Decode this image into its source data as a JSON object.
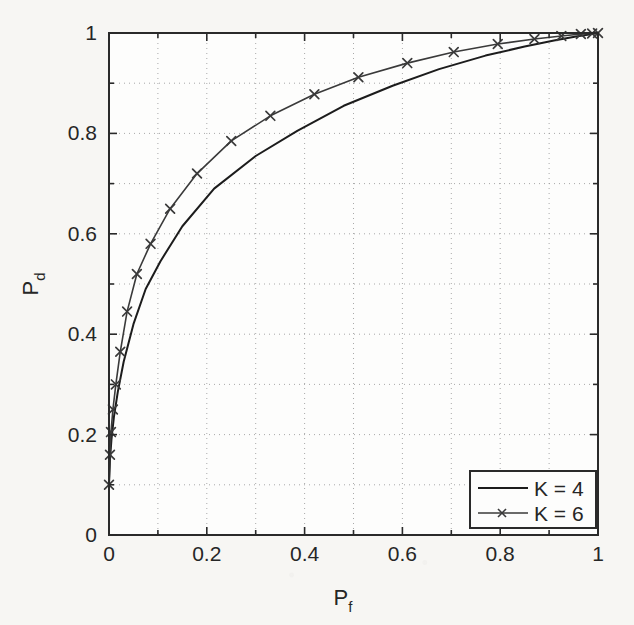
{
  "chart_data": {
    "type": "line",
    "title": "",
    "subtitle": "",
    "xlabel": "P_f",
    "ylabel": "P_d",
    "xlabel_base": "P",
    "xlabel_sub": "f",
    "ylabel_base": "P",
    "ylabel_sub": "d",
    "xlim": [
      0,
      1
    ],
    "ylim": [
      0,
      1
    ],
    "xticks": [
      0,
      0.2,
      0.4,
      0.6,
      0.8,
      1
    ],
    "yticks": [
      0,
      0.2,
      0.4,
      0.6,
      0.8,
      1
    ],
    "xtick_labels": [
      "0",
      "0.2",
      "0.4",
      "0.6",
      "0.8",
      "1"
    ],
    "ytick_labels": [
      "0",
      "0.2",
      "0.4",
      "0.6",
      "0.8",
      "1"
    ],
    "minor_tick_step": 0.1,
    "grid": true,
    "grid_style": "dotted",
    "grid_color": "#9a9a9a",
    "axis_color": "#2a2a2a",
    "background_color": "#f7f6f3",
    "legend_position": "lower right",
    "series": [
      {
        "name": "K = 4",
        "marker": "none",
        "color": "#1c1c1c",
        "line_width": 2.0,
        "x": [
          0.0,
          0.002,
          0.005,
          0.01,
          0.018,
          0.03,
          0.05,
          0.075,
          0.105,
          0.15,
          0.215,
          0.3,
          0.385,
          0.48,
          0.58,
          0.675,
          0.77,
          0.85,
          0.91,
          0.955,
          0.982,
          1.0
        ],
        "y": [
          0.1,
          0.15,
          0.19,
          0.235,
          0.285,
          0.345,
          0.42,
          0.49,
          0.545,
          0.615,
          0.69,
          0.755,
          0.805,
          0.855,
          0.895,
          0.928,
          0.955,
          0.973,
          0.985,
          0.993,
          0.997,
          1.0
        ]
      },
      {
        "name": "K = 6",
        "marker": "x",
        "color": "#3a3a3a",
        "line_width": 1.6,
        "x": [
          0.0,
          0.002,
          0.004,
          0.008,
          0.014,
          0.023,
          0.037,
          0.057,
          0.085,
          0.125,
          0.18,
          0.25,
          0.33,
          0.42,
          0.51,
          0.61,
          0.705,
          0.795,
          0.87,
          0.925,
          0.965,
          0.988,
          1.0
        ],
        "y": [
          0.1,
          0.16,
          0.205,
          0.25,
          0.3,
          0.365,
          0.445,
          0.52,
          0.58,
          0.65,
          0.72,
          0.785,
          0.835,
          0.878,
          0.912,
          0.94,
          0.962,
          0.978,
          0.988,
          0.994,
          0.998,
          0.999,
          1.0
        ],
        "markers_x": [
          0.0,
          0.002,
          0.004,
          0.008,
          0.014,
          0.023,
          0.037,
          0.057,
          0.085,
          0.125,
          0.18,
          0.25,
          0.33,
          0.42,
          0.51,
          0.61,
          0.705,
          0.795,
          0.87,
          0.925,
          0.965,
          0.988,
          1.0
        ],
        "markers_y": [
          0.1,
          0.16,
          0.205,
          0.25,
          0.3,
          0.365,
          0.445,
          0.52,
          0.58,
          0.65,
          0.72,
          0.785,
          0.835,
          0.878,
          0.912,
          0.94,
          0.962,
          0.978,
          0.988,
          0.994,
          0.998,
          0.999,
          1.0
        ]
      }
    ],
    "legend": [
      {
        "label": "K = 4",
        "marker": "none"
      },
      {
        "label": "K = 6",
        "marker": "x"
      }
    ]
  },
  "legend_entries": {
    "entry0_label": "K = 4",
    "entry1_label": "K = 6"
  },
  "axis_labels": {
    "x_base": "P",
    "x_sub": "f",
    "y_base": "P",
    "y_sub": "d"
  }
}
